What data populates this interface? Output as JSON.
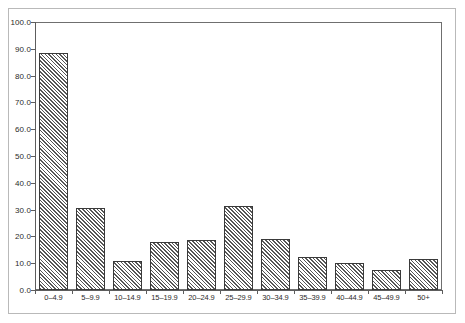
{
  "chart_data": {
    "type": "bar",
    "title": "",
    "subtitle": "",
    "xlabel": "",
    "ylabel": "",
    "categories": [
      "0–4.9",
      "5–9.9",
      "10–14.9",
      "15–19.9",
      "20–24.9",
      "25–29.9",
      "30–34.9",
      "35–39.9",
      "40–44.9",
      "45–49.9",
      "50+"
    ],
    "values": [
      88.5,
      30.5,
      11.0,
      18.0,
      18.5,
      31.5,
      19.0,
      12.5,
      10.0,
      7.5,
      11.5
    ],
    "ylim": [
      0.0,
      100.0
    ],
    "ytick_labels": [
      "0.0",
      "10.0",
      "20.0",
      "30.0",
      "40.0",
      "50.0",
      "60.0",
      "70.0",
      "80.0",
      "90.0",
      "100.0"
    ],
    "ytick_values": [
      0,
      10,
      20,
      30,
      40,
      50,
      60,
      70,
      80,
      90,
      100
    ],
    "grid": false,
    "legend": null,
    "legend_position": "none",
    "bar_fill": "diagonal-hatch",
    "bar_edge_color": "#3a3a3a",
    "bar_hatch_color": "#565656",
    "axis_color": "#5d5d5d",
    "frame_color": "#b9b9b9",
    "background_color": "#ffffff"
  }
}
